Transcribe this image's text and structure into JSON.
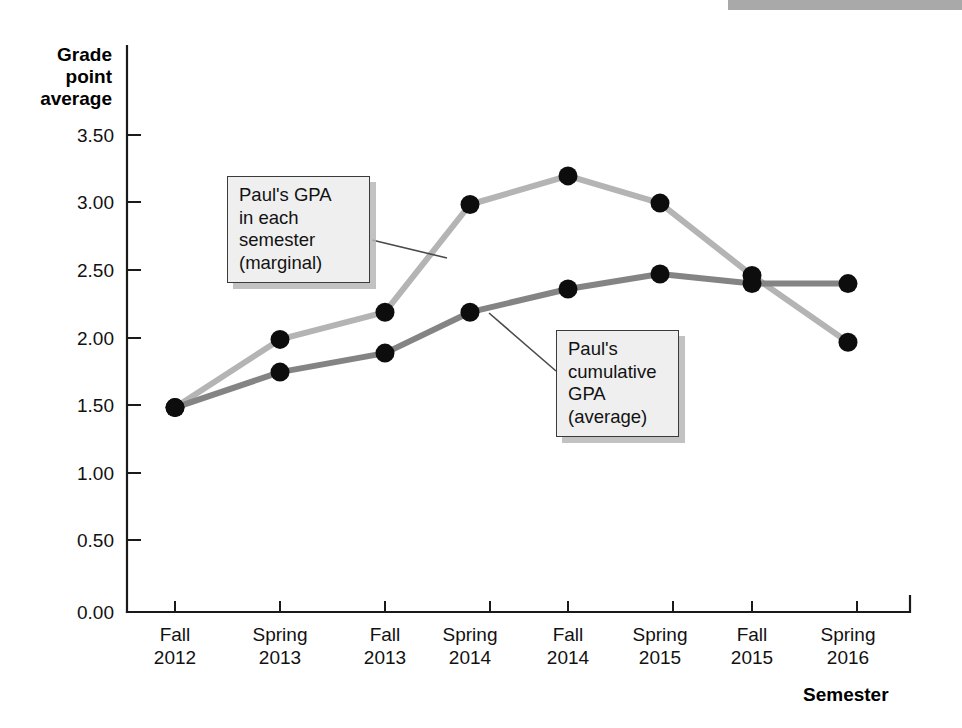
{
  "chart_data": {
    "type": "line",
    "title": "",
    "xlabel": "Semester",
    "ylabel": "Grade point average",
    "categories": [
      "Fall 2012",
      "Spring 2013",
      "Fall 2013",
      "Spring 2014",
      "Fall 2014",
      "Spring 2015",
      "Fall 2015",
      "Spring 2016"
    ],
    "x_tick_lines": [
      {
        "term": "Fall",
        "year": "2012"
      },
      {
        "term": "Spring",
        "year": "2013"
      },
      {
        "term": "Fall",
        "year": "2013"
      },
      {
        "term": "Spring",
        "year": "2014"
      },
      {
        "term": "Fall",
        "year": "2014"
      },
      {
        "term": "Spring",
        "year": "2015"
      },
      {
        "term": "Fall",
        "year": "2015"
      },
      {
        "term": "Spring",
        "year": "2016"
      }
    ],
    "y_tick_labels": [
      "3.50",
      "3.00",
      "2.50",
      "2.00",
      "1.50",
      "1.00",
      "0.50",
      "0.00"
    ],
    "y_tick_values": [
      3.5,
      3.0,
      2.5,
      2.0,
      1.5,
      1.0,
      0.5,
      0.0
    ],
    "ylim": [
      0.0,
      3.75
    ],
    "grid": false,
    "legend": "annotations",
    "series": [
      {
        "name": "Paul's GPA in each semester (marginal)",
        "color": "#b4b4b4",
        "values": [
          1.5,
          2.0,
          2.2,
          2.99,
          3.2,
          3.0,
          2.47,
          1.98
        ]
      },
      {
        "name": "Paul's cumulative GPA (average)",
        "color": "#848484",
        "values": [
          1.5,
          1.76,
          1.9,
          2.2,
          2.37,
          2.48,
          2.41,
          2.41
        ]
      }
    ],
    "annotations": [
      {
        "id": "marginal",
        "text": "Paul's GPA\nin each\nsemester\n(marginal)",
        "points_to_series": "Paul's GPA in each semester (marginal)"
      },
      {
        "id": "cumulative",
        "text": "Paul's\ncumulative\nGPA\n(average)",
        "points_to_series": "Paul's cumulative GPA (average)"
      }
    ]
  },
  "axes": {
    "y_axis_title": "Grade\npoint\naverage",
    "x_axis_title": "Semester"
  },
  "colors": {
    "marginal_line": "#b4b4b4",
    "cumulative_line": "#848484",
    "marker": "#0d0d0d",
    "axis": "#1a1a1a",
    "callout_fill": "#efefef",
    "callout_border": "#3b3b3b"
  }
}
